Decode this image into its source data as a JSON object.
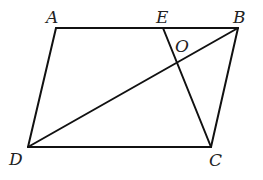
{
  "diagram": {
    "type": "parallelogram",
    "stroke_color": "#111111",
    "label_color": "#222222",
    "points": {
      "A": {
        "label": "A",
        "x": 56,
        "y": 28,
        "lx": 46,
        "ly": 23
      },
      "E": {
        "label": "E",
        "x": 163,
        "y": 28,
        "lx": 156,
        "ly": 23
      },
      "B": {
        "label": "B",
        "x": 238,
        "y": 28,
        "lx": 233,
        "ly": 23
      },
      "O": {
        "label": "O",
        "x": 176,
        "y": 62,
        "lx": 175,
        "ly": 52
      },
      "D": {
        "label": "D",
        "x": 28,
        "y": 147,
        "lx": 9,
        "ly": 165
      },
      "C": {
        "label": "C",
        "x": 211,
        "y": 147,
        "lx": 209,
        "ly": 166
      }
    },
    "segments": [
      {
        "from": "A",
        "to": "B"
      },
      {
        "from": "B",
        "to": "C"
      },
      {
        "from": "C",
        "to": "D"
      },
      {
        "from": "D",
        "to": "A"
      },
      {
        "from": "B",
        "to": "D"
      },
      {
        "from": "E",
        "to": "C"
      }
    ]
  }
}
